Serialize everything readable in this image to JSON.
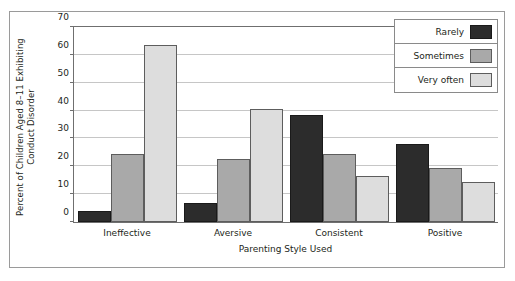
{
  "chart_data": {
    "type": "bar",
    "title": "",
    "xlabel": "Parenting Style Used",
    "ylabel": "Percent of Children Aged 8–11 Exhibiting Conduct Disorder",
    "categories": [
      "Ineffective",
      "Aversive",
      "Consistent",
      "Positive"
    ],
    "series": [
      {
        "name": "Rarely",
        "color": "#2c2c2c",
        "values": [
          4,
          7,
          38.5,
          28
        ]
      },
      {
        "name": "Sometimes",
        "color": "#a9a9a9",
        "values": [
          24.5,
          22.5,
          24.5,
          19.5
        ]
      },
      {
        "name": "Very often",
        "color": "#dddddd",
        "values": [
          63.5,
          40.5,
          16.5,
          14.5
        ]
      }
    ],
    "ylim": [
      0,
      70
    ],
    "yticks": [
      0,
      10,
      20,
      30,
      40,
      50,
      60,
      70
    ],
    "grid": true,
    "legend_position": "top-right",
    "frame": true
  }
}
